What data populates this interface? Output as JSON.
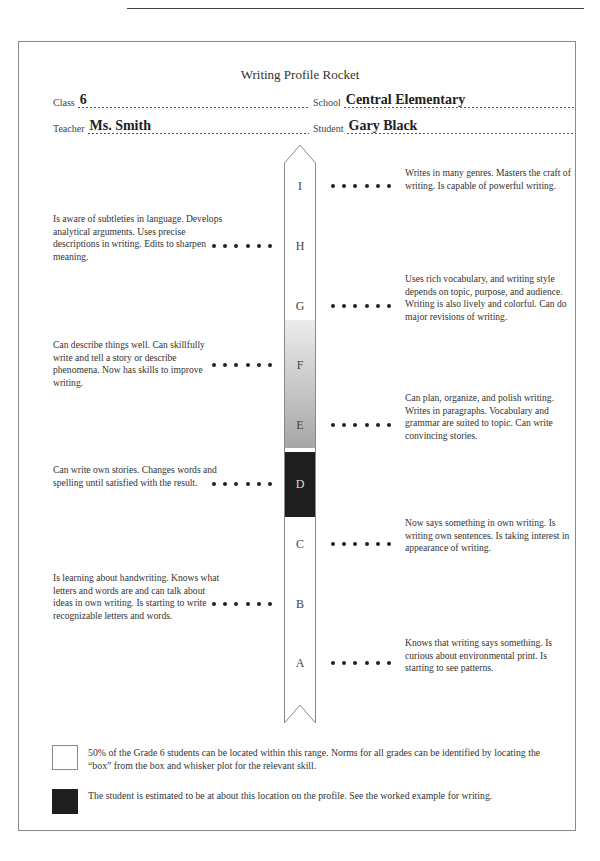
{
  "document": {
    "title": "Writing Profile Rocket"
  },
  "header": {
    "class": {
      "label": "Class",
      "value": "6"
    },
    "school": {
      "label": "School",
      "value": "Central Elementary"
    },
    "teacher": {
      "label": "Teacher",
      "value": "Ms. Smith"
    },
    "student": {
      "label": "Student",
      "value": "Gary Black"
    }
  },
  "rocket": {
    "levels": [
      {
        "letter": "I",
        "side": "right",
        "description": "Writes in many genres. Masters the craft of writing. Is capable of powerful writing."
      },
      {
        "letter": "H",
        "side": "left",
        "description": "Is aware of subtleties in language. Develops analytical arguments. Uses precise descriptions in writing. Edits to sharpen meaning."
      },
      {
        "letter": "G",
        "side": "right",
        "description": "Uses rich vocabulary, and writing style depends on topic, purpose, and audience. Writing is also lively and colorful. Can do major revisions of writing."
      },
      {
        "letter": "F",
        "side": "left",
        "description": "Can describe things well. Can skillfully write and tell a story or describe phenomena. Now has skills to improve writing."
      },
      {
        "letter": "E",
        "side": "right",
        "description": "Can plan, organize, and polish writing. Writes in paragraphs. Vocabulary and grammar are suited to topic. Can write convincing stories."
      },
      {
        "letter": "D",
        "side": "left",
        "description": "Can write own stories. Changes words and spelling until satisfied with the result."
      },
      {
        "letter": "C",
        "side": "right",
        "description": "Now says something in own writing. Is writing own sentences. Is taking interest in appearance of writing."
      },
      {
        "letter": "B",
        "side": "left",
        "description": "Is learning about handwriting. Knows what letters and words are and can talk about ideas in own writing. Is starting to write recognizable letters and words."
      },
      {
        "letter": "A",
        "side": "right",
        "description": "Knows that writing says something. Is curious about environmental print. Is starting to see patterns."
      }
    ],
    "norm_range": {
      "from_level": "E",
      "to_level": "F",
      "style": "gray-gradient"
    },
    "student_position": {
      "level": "D",
      "style": "black-box"
    }
  },
  "legend": {
    "norm_box_text": "50% of the Grade 6 students can be located within this range. Norms for all grades can be identified by locating the “box” from the box and whisker plot for the relevant skill.",
    "student_box_text": "The student is estimated to be at about this location on the profile. See the worked example for writing."
  },
  "colors": {
    "norm_gradient_top": "#ececec",
    "norm_gradient_bottom": "#a6a6a6",
    "student_marker": "#1e1e1e",
    "outline": "#8a8a8a"
  }
}
